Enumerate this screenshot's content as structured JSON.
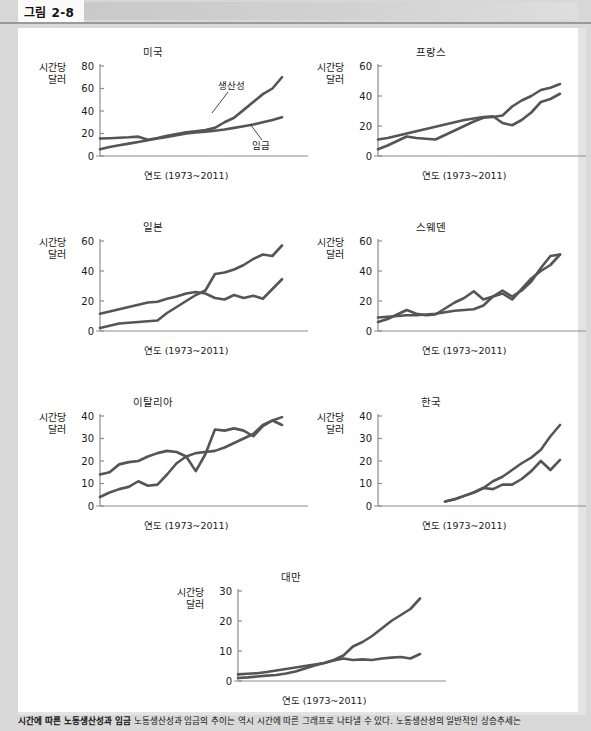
{
  "header": {
    "figure_label": "그림 2-8"
  },
  "axis_common": {
    "y_title_line1": "시간당",
    "y_title_line2": "달러",
    "x_label": "연도 (1973~2011)"
  },
  "series_tags": {
    "productivity": "생산성",
    "wage": "임금"
  },
  "caption": {
    "bold": "시간에 따른 노동생산성과 임금",
    "body": "  노동생산성과 임금의 추이는 역시 시간에 따른 그래프로 나타낼 수 있다. 노동생산성의 일반적인 상승추세는"
  },
  "chart_data": [
    {
      "type": "line",
      "title": "미국",
      "xlabel": "연도 (1973~2011)",
      "ylabel": "시간당 달러",
      "ylim": [
        0,
        80
      ],
      "yticks": [
        0,
        20,
        40,
        60,
        80
      ],
      "x": [
        1973,
        1975,
        1977,
        1979,
        1981,
        1983,
        1985,
        1987,
        1989,
        1991,
        1993,
        1995,
        1997,
        1999,
        2001,
        2003,
        2005,
        2007,
        2009,
        2011
      ],
      "series": [
        {
          "name": "생산성",
          "values": [
            15.5,
            15.8,
            16.2,
            16.6,
            17.2,
            14.5,
            16.0,
            18.0,
            19.5,
            21.0,
            22.0,
            23.0,
            25.0,
            30.0,
            34.0,
            41.0,
            48.0,
            55.0,
            60.0,
            70.0
          ]
        },
        {
          "name": "임금",
          "values": [
            6.0,
            8.0,
            9.5,
            11.0,
            12.5,
            14.0,
            15.5,
            17.0,
            18.5,
            20.0,
            21.0,
            21.5,
            22.5,
            23.5,
            25.0,
            26.5,
            28.0,
            30.0,
            32.0,
            34.5
          ]
        }
      ],
      "annotations": [
        {
          "text": "생산성",
          "target": "upper-line"
        },
        {
          "text": "임금",
          "target": "lower-line"
        }
      ]
    },
    {
      "type": "line",
      "title": "프랑스",
      "xlabel": "연도 (1973~2011)",
      "ylabel": "시간당 달러",
      "ylim": [
        0,
        60
      ],
      "yticks": [
        0,
        20,
        40,
        60
      ],
      "x": [
        1973,
        1975,
        1977,
        1979,
        1981,
        1983,
        1985,
        1987,
        1989,
        1991,
        1993,
        1995,
        1997,
        1999,
        2001,
        2003,
        2005,
        2007,
        2009,
        2011
      ],
      "series": [
        {
          "name": "A",
          "values": [
            4.5,
            7.0,
            10.0,
            13.0,
            12.0,
            11.5,
            11.0,
            14.0,
            17.0,
            20.0,
            23.0,
            25.5,
            26.0,
            27.0,
            33.0,
            37.0,
            40.0,
            44.0,
            45.5,
            48.0
          ]
        },
        {
          "name": "B",
          "values": [
            11.0,
            12.0,
            13.5,
            15.0,
            16.5,
            18.0,
            19.5,
            21.0,
            22.5,
            24.0,
            25.0,
            26.0,
            26.5,
            22.0,
            20.5,
            24.0,
            29.0,
            36.0,
            38.0,
            41.5
          ]
        }
      ]
    },
    {
      "type": "line",
      "title": "일본",
      "xlabel": "연도 (1973~2011)",
      "ylabel": "시간당 달러",
      "ylim": [
        0,
        60
      ],
      "yticks": [
        0,
        20,
        40,
        60
      ],
      "x": [
        1973,
        1975,
        1977,
        1979,
        1981,
        1983,
        1985,
        1987,
        1989,
        1991,
        1993,
        1995,
        1997,
        1999,
        2001,
        2003,
        2005,
        2007,
        2009,
        2011
      ],
      "series": [
        {
          "name": "A",
          "values": [
            2.0,
            3.5,
            5.0,
            5.5,
            6.0,
            6.5,
            7.0,
            12.0,
            16.0,
            20.0,
            24.0,
            27.0,
            38.0,
            39.0,
            41.0,
            44.0,
            48.0,
            51.0,
            50.0,
            57.0
          ]
        },
        {
          "name": "B",
          "values": [
            11.5,
            13.0,
            14.5,
            16.0,
            17.5,
            19.0,
            19.5,
            21.5,
            23.0,
            25.0,
            26.0,
            25.0,
            22.0,
            21.0,
            24.0,
            22.0,
            23.5,
            21.5,
            28.0,
            34.5
          ]
        }
      ]
    },
    {
      "type": "line",
      "title": "스웨덴",
      "xlabel": "연도 (1973~2011)",
      "ylabel": "시간당 달러",
      "ylim": [
        0,
        60
      ],
      "yticks": [
        0,
        20,
        40,
        60
      ],
      "x": [
        1973,
        1975,
        1977,
        1979,
        1981,
        1983,
        1985,
        1987,
        1989,
        1991,
        1993,
        1995,
        1997,
        1999,
        2001,
        2003,
        2005,
        2007,
        2009,
        2011
      ],
      "series": [
        {
          "name": "A",
          "values": [
            6.0,
            8.0,
            11.0,
            14.0,
            11.5,
            10.5,
            11.0,
            15.0,
            19.0,
            22.0,
            26.5,
            21.0,
            23.0,
            27.0,
            23.0,
            27.0,
            33.0,
            42.0,
            50.0,
            51.0
          ]
        },
        {
          "name": "B",
          "values": [
            9.0,
            9.5,
            10.0,
            10.5,
            10.5,
            11.0,
            11.5,
            12.5,
            13.5,
            14.0,
            14.5,
            17.0,
            23.0,
            25.0,
            21.0,
            28.0,
            35.0,
            40.0,
            44.0,
            51.0
          ]
        }
      ]
    },
    {
      "type": "line",
      "title": "이탈리아",
      "xlabel": "연도 (1973~2011)",
      "ylabel": "시간당 달러",
      "ylim": [
        0,
        40
      ],
      "yticks": [
        0,
        10,
        20,
        30,
        40
      ],
      "x": [
        1973,
        1975,
        1977,
        1979,
        1981,
        1983,
        1985,
        1987,
        1989,
        1991,
        1993,
        1995,
        1997,
        1999,
        2001,
        2003,
        2005,
        2007,
        2009,
        2011
      ],
      "series": [
        {
          "name": "A",
          "values": [
            4.0,
            6.0,
            7.5,
            8.5,
            11.0,
            9.0,
            9.5,
            14.0,
            19.0,
            22.0,
            23.5,
            24.0,
            24.5,
            26.0,
            28.0,
            30.0,
            32.0,
            36.0,
            38.0,
            39.5
          ]
        },
        {
          "name": "B",
          "values": [
            14.0,
            15.0,
            18.5,
            19.5,
            20.0,
            22.0,
            23.5,
            24.5,
            24.0,
            22.0,
            15.5,
            23.0,
            34.0,
            33.5,
            34.5,
            33.5,
            31.0,
            35.5,
            38.0,
            36.0
          ]
        }
      ]
    },
    {
      "type": "line",
      "title": "한국",
      "xlabel": "연도 (1973~2011)",
      "ylabel": "시간당 달러",
      "ylim": [
        0,
        40
      ],
      "yticks": [
        0,
        10,
        20,
        30,
        40
      ],
      "x": [
        1987,
        1989,
        1991,
        1993,
        1995,
        1997,
        1999,
        2001,
        2003,
        2005,
        2007,
        2009,
        2011
      ],
      "series": [
        {
          "name": "A",
          "values": [
            2.0,
            3.0,
            4.5,
            6.0,
            8.0,
            11.0,
            13.0,
            16.0,
            19.0,
            21.5,
            25.0,
            31.0,
            36.0
          ]
        },
        {
          "name": "B",
          "values": [
            2.0,
            3.0,
            4.5,
            6.0,
            8.0,
            7.5,
            9.5,
            9.5,
            12.0,
            15.5,
            20.0,
            16.0,
            20.5
          ]
        }
      ]
    },
    {
      "type": "line",
      "title": "대만",
      "xlabel": "연도 (1973~2011)",
      "ylabel": "시간당 달러",
      "ylim": [
        0,
        30
      ],
      "yticks": [
        0,
        10,
        20,
        30
      ],
      "x": [
        1973,
        1975,
        1977,
        1979,
        1981,
        1983,
        1985,
        1987,
        1989,
        1991,
        1993,
        1995,
        1997,
        1999,
        2001,
        2003,
        2005,
        2007,
        2009,
        2011
      ],
      "series": [
        {
          "name": "A",
          "values": [
            1.0,
            1.2,
            1.5,
            1.8,
            2.0,
            2.5,
            3.2,
            4.2,
            5.2,
            6.0,
            7.0,
            8.5,
            11.5,
            13.0,
            15.0,
            17.5,
            20.0,
            22.0,
            24.0,
            27.5
          ]
        },
        {
          "name": "B",
          "values": [
            2.2,
            2.4,
            2.6,
            3.0,
            3.5,
            4.0,
            4.5,
            5.0,
            5.5,
            6.0,
            6.8,
            7.5,
            7.0,
            7.2,
            7.0,
            7.5,
            7.8,
            8.0,
            7.5,
            9.0
          ]
        }
      ]
    }
  ]
}
